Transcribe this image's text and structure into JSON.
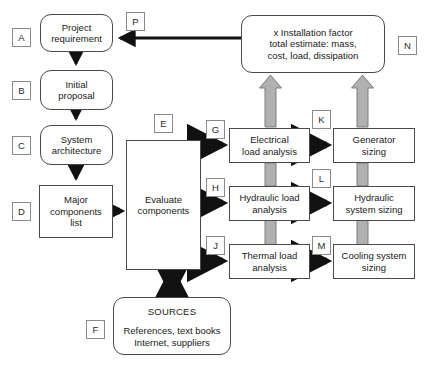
{
  "diagram": {
    "nodes": [
      {
        "id": "project_requirement",
        "label": "Project requirement",
        "lines": [
          "Project",
          "requirement"
        ],
        "shape": "rounded"
      },
      {
        "id": "initial_proposal",
        "label": "Initial proposal",
        "lines": [
          "Initial",
          "proposal"
        ],
        "shape": "rounded"
      },
      {
        "id": "system_architecture",
        "label": "System architecture",
        "lines": [
          "System",
          "architecture"
        ],
        "shape": "rounded"
      },
      {
        "id": "major_components_list",
        "label": "Major components list",
        "lines": [
          "Major",
          "components",
          "list"
        ],
        "shape": "rect"
      },
      {
        "id": "evaluate_components",
        "label": "Evaluate components",
        "lines": [
          "Evaluate",
          "components"
        ],
        "shape": "rect"
      },
      {
        "id": "sources",
        "label": "SOURCES",
        "title": "SOURCES",
        "lines": [
          "References, text books",
          "Internet, suppliers"
        ],
        "shape": "rounded"
      },
      {
        "id": "electrical_load_analysis",
        "label": "Electrical load analysis",
        "lines": [
          "Electrical",
          "load analysis"
        ],
        "shape": "rect"
      },
      {
        "id": "hydraulic_load_analysis",
        "label": "Hydraulic load analysis",
        "lines": [
          "Hydraulic load",
          "analysis"
        ],
        "shape": "rect"
      },
      {
        "id": "thermal_load_analysis",
        "label": "Thermal load analysis",
        "lines": [
          "Thermal load",
          "analysis"
        ],
        "shape": "rect"
      },
      {
        "id": "generator_sizing",
        "label": "Generator sizing",
        "lines": [
          "Generator",
          "sizing"
        ],
        "shape": "rect"
      },
      {
        "id": "hydraulic_system_sizing",
        "label": "Hydraulic system sizing",
        "lines": [
          "Hydraulic",
          "system sizing"
        ],
        "shape": "rect"
      },
      {
        "id": "cooling_system_sizing",
        "label": "Cooling system sizing",
        "lines": [
          "Cooling system",
          "sizing"
        ],
        "shape": "rect"
      },
      {
        "id": "installation_factor",
        "label": "x Installation factor total estimate: mass, cost, load, dissipation",
        "lines": [
          "x Installation factor",
          "total estimate: mass,",
          "cost, load, dissipation"
        ],
        "shape": "rounded"
      }
    ],
    "node_text": {
      "project_requirement_l1": "Project",
      "project_requirement_l2": "requirement",
      "initial_proposal_l1": "Initial",
      "initial_proposal_l2": "proposal",
      "system_architecture_l1": "System",
      "system_architecture_l2": "architecture",
      "major_components_l1": "Major",
      "major_components_l2": "components",
      "major_components_l3": "list",
      "evaluate_components_l1": "Evaluate",
      "evaluate_components_l2": "components",
      "sources_title": "SOURCES",
      "sources_l1": "References, text books",
      "sources_l2": "Internet, suppliers",
      "electrical_l1": "Electrical",
      "electrical_l2": "load analysis",
      "hydraulic_l1": "Hydraulic load",
      "hydraulic_l2": "analysis",
      "thermal_l1": "Thermal load",
      "thermal_l2": "analysis",
      "generator_l1": "Generator",
      "generator_l2": "sizing",
      "hyd_sizing_l1": "Hydraulic",
      "hyd_sizing_l2": "system sizing",
      "cooling_l1": "Cooling system",
      "cooling_l2": "sizing",
      "installation_l1": "x Installation factor",
      "installation_l2": "total estimate: mass,",
      "installation_l3": "cost, load, dissipation"
    },
    "tags": {
      "a": "A",
      "b": "B",
      "c": "C",
      "d": "D",
      "e": "E",
      "f": "F",
      "g": "G",
      "h": "H",
      "j": "J",
      "k": "K",
      "l": "L",
      "m": "M",
      "n": "N",
      "p": "P"
    },
    "colors": {
      "background": "#ffffff",
      "node_border": "#4a4a4a",
      "tag_border": "#8a8a8a",
      "arrow_black": "#111111",
      "arrow_gray": "#b0b0b0",
      "arrow_gray_edge": "#7d7d7d",
      "text": "#1a1a1a"
    }
  }
}
